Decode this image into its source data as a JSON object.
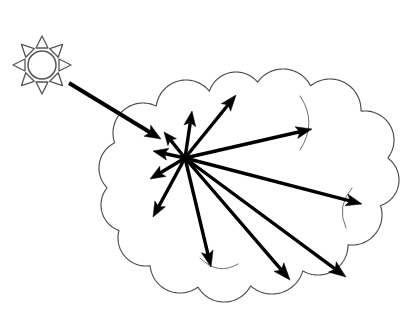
{
  "figure": {
    "background_color": "#ffffff",
    "width": 410,
    "height": 311,
    "ink_color": "#000000",
    "outline_color": "#4a4a4a"
  },
  "sun": {
    "label": "sun",
    "center_x": 42,
    "center_y": 65,
    "disc_radius": 14,
    "ray_count": 8,
    "ray_inner_radius": 17,
    "ray_outer_radius": 29,
    "ray_half_width": 6,
    "stroke_color": "#55555a"
  },
  "cloud": {
    "label": "cloud",
    "bumps": [
      {
        "cx": 143,
        "cy": 133,
        "r": 30
      },
      {
        "cx": 186,
        "cy": 110,
        "r": 30
      },
      {
        "cx": 236,
        "cy": 100,
        "r": 28
      },
      {
        "cx": 283,
        "cy": 100,
        "r": 31
      },
      {
        "cx": 330,
        "cy": 110,
        "r": 31
      },
      {
        "cx": 365,
        "cy": 140,
        "r": 29
      },
      {
        "cx": 372,
        "cy": 180,
        "r": 27
      },
      {
        "cx": 352,
        "cy": 215,
        "r": 30
      },
      {
        "cx": 318,
        "cy": 245,
        "r": 30
      },
      {
        "cx": 272,
        "cy": 262,
        "r": 32
      },
      {
        "cx": 224,
        "cy": 272,
        "r": 30
      },
      {
        "cx": 180,
        "cy": 263,
        "r": 30
      },
      {
        "cx": 146,
        "cy": 238,
        "r": 28
      },
      {
        "cx": 128,
        "cy": 205,
        "r": 27
      },
      {
        "cx": 127,
        "cy": 168,
        "r": 28
      }
    ],
    "fill_color": "#ffffff",
    "stroke_color": "#4a4a4a"
  },
  "scattering_center": {
    "label": "scattering-center",
    "x": 185,
    "y": 158
  },
  "incident_ray": {
    "label": "incident-sunlight-ray",
    "from_x": 69,
    "from_y": 83,
    "to_x": 161,
    "to_y": 139,
    "width": 4.0,
    "head_length": 16,
    "head_width": 13
  },
  "scattered_rays": [
    {
      "name": "scattered-ray-up-left-short",
      "to_x": 164,
      "to_y": 132,
      "width": 3.4,
      "head_length": 13,
      "head_width": 11
    },
    {
      "name": "scattered-ray-left",
      "to_x": 153,
      "to_y": 151,
      "width": 3.4,
      "head_length": 15,
      "head_width": 12
    },
    {
      "name": "scattered-ray-down-left-short",
      "to_x": 150,
      "to_y": 179,
      "width": 3.4,
      "head_length": 15,
      "head_width": 12
    },
    {
      "name": "scattered-ray-down-left-long",
      "to_x": 153,
      "to_y": 217,
      "width": 3.4,
      "head_length": 15,
      "head_width": 12
    },
    {
      "name": "scattered-ray-up",
      "to_x": 192,
      "to_y": 111,
      "width": 3.4,
      "head_length": 15,
      "head_width": 12
    },
    {
      "name": "scattered-ray-up-right",
      "to_x": 236,
      "to_y": 95,
      "width": 3.4,
      "head_length": 16,
      "head_width": 12
    },
    {
      "name": "scattered-ray-right",
      "to_x": 312,
      "to_y": 129,
      "width": 3.4,
      "head_length": 16,
      "head_width": 12
    },
    {
      "name": "scattered-ray-far-right",
      "to_x": 362,
      "to_y": 204,
      "width": 3.4,
      "head_length": 16,
      "head_width": 12
    },
    {
      "name": "scattered-ray-down",
      "to_x": 211,
      "to_y": 267,
      "width": 3.4,
      "head_length": 16,
      "head_width": 12
    },
    {
      "name": "scattered-ray-down-right",
      "to_x": 290,
      "to_y": 280,
      "width": 3.4,
      "head_length": 17,
      "head_width": 13
    },
    {
      "name": "scattered-ray-down-right-far",
      "to_x": 346,
      "to_y": 277,
      "width": 3.4,
      "head_length": 17,
      "head_width": 13
    }
  ]
}
